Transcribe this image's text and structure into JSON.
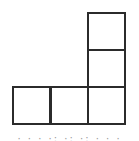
{
  "diagram": {
    "type": "polyomino",
    "shape": "L-pentomino",
    "cell_size_px": 37,
    "line_color": "#2b2b2b",
    "background": "#ffffff",
    "cells": [
      {
        "row": 0,
        "col": 2,
        "x": 87,
        "y": 12
      },
      {
        "row": 1,
        "col": 2,
        "x": 87,
        "y": 49
      },
      {
        "row": 2,
        "col": 0,
        "x": 12,
        "y": 86
      },
      {
        "row": 2,
        "col": 1,
        "x": 50,
        "y": 86
      },
      {
        "row": 2,
        "col": 2,
        "x": 87,
        "y": 86
      }
    ],
    "grid": {
      "rows": 3,
      "cols": 3,
      "filled_count": 5
    }
  },
  "caption": {
    "text": "· · · ·: ·: ·: · · ·"
  }
}
